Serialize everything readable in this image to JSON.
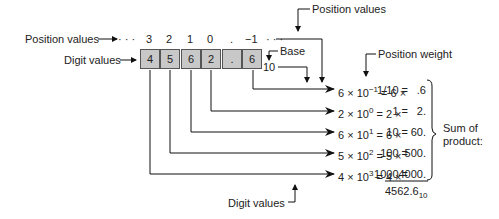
{
  "labels": {
    "position_values_left": "Position values",
    "position_values_top": "Position values",
    "digit_values_left": "Digit values",
    "digit_values_bottom": "Digit values",
    "base": "Base",
    "base_value": "10",
    "position_weight": "Position weight",
    "sum_of_product_1": "Sum of",
    "sum_of_product_2": "product:"
  },
  "positions": [
    "3",
    "2",
    "1",
    "0",
    ".",
    "−1"
  ],
  "ellipsis": "· · ·",
  "digits": [
    "4",
    "5",
    "6",
    "2",
    ".",
    "6"
  ],
  "rows": [
    {
      "digit": "6",
      "exp": "−1",
      "weight": "1/10 =",
      "product": ".6"
    },
    {
      "digit": "2",
      "exp": "0",
      "weight": "1 =",
      "product": "2."
    },
    {
      "digit": "6",
      "exp": "1",
      "weight": "10 =",
      "product": "60."
    },
    {
      "digit": "5",
      "exp": "2",
      "weight": "100 =",
      "product": "500."
    },
    {
      "digit": "4",
      "exp": "3",
      "weight": "1000 =",
      "product": "4000."
    }
  ],
  "result": {
    "value": "4562.6",
    "base": "10"
  }
}
